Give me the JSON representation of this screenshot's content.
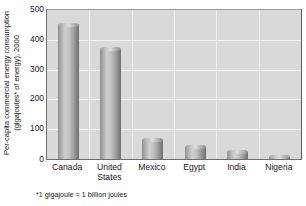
{
  "chart_data": {
    "type": "bar",
    "title": "",
    "subtitle": "",
    "xlabel": "",
    "ylabel": "Per-capita commercial energy consumption (gigajoules* of energy), 2000",
    "ylabel_line1": "Per-capita commercial energy consumption",
    "ylabel_line2": "(gigajoules* of energy), 2000",
    "categories": [
      "Canada",
      "United States",
      "Mexico",
      "Egypt",
      "India",
      "Nigeria"
    ],
    "category_lines": [
      [
        "Canada"
      ],
      [
        "United",
        "States"
      ],
      [
        "Mexico"
      ],
      [
        "Egypt"
      ],
      [
        "India"
      ],
      [
        "Nigeria"
      ]
    ],
    "values": [
      450,
      370,
      63,
      40,
      22,
      8
    ],
    "ylim": [
      0,
      500
    ],
    "ytick_values": [
      500,
      400,
      300,
      200,
      100
    ],
    "ytick_labels": [
      "500",
      "400",
      "300",
      "200",
      "100"
    ],
    "zero_label": "0",
    "grid": true,
    "grid_orientation": "horizontal-and-vertical",
    "legend": false,
    "legend_position": "none",
    "bar_style": "3d-cylinder",
    "annotations": [
      "*1 gigajoule = 1 billion joules"
    ],
    "footnote": "*1 gigajoule = 1 billion joules"
  },
  "colors": {
    "page_background": "#ffffff",
    "plot_background": "#d9d9d9",
    "gridline": "#f2fof2",
    "gridline_horizontal": "#f2f2f2",
    "gridline_vertical": "#ececec",
    "bar_light": "#cfcfcf",
    "bar_dark": "#6f6f6f",
    "text": "#1a1a1a",
    "plot_border": "#6e6e6e"
  }
}
